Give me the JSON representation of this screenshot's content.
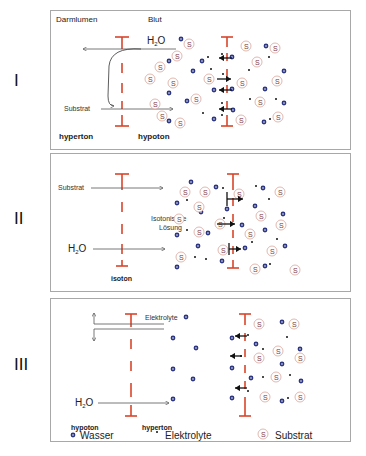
{
  "panels": [
    {
      "roman": "I",
      "labels": {
        "left_top": "Darmlumen",
        "right_top": "Blut",
        "water": "H2O",
        "substrate": "Substrat",
        "left_bottom": "hyperton",
        "right_bottom": "hypoton"
      }
    },
    {
      "roman": "II",
      "labels": {
        "substrate": "Substrat",
        "water": "H2O",
        "solution_line1": "Isotonische",
        "solution_line2": "Lösung",
        "bottom": "isoton"
      }
    },
    {
      "roman": "III",
      "labels": {
        "electrolytes": "Elektrolyte",
        "water": "H2O",
        "left_bottom": "hypoton",
        "right_bottom": "hyperton"
      }
    }
  ],
  "legend": {
    "water": "Wasser",
    "electrolytes": "Elektrolyte",
    "substrate": "Substrat",
    "substrate_symbol": "S"
  },
  "colors": {
    "membrane": "#d9452a",
    "water": "#2b3580",
    "substrate_ring": "#d9a59a",
    "arrow": "#555555",
    "border": "#a8a8a8"
  }
}
